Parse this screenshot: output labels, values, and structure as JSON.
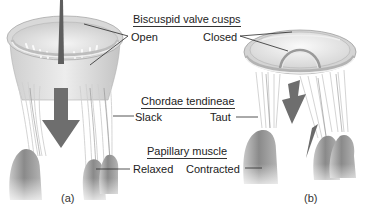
{
  "diagram": {
    "palette": {
      "background": "#ffffff",
      "tissue_light": "#e4e4e4",
      "tissue_mid": "#b8b8b8",
      "muscle_dark": "#8a8a8a",
      "arrow": "#6e6e6e",
      "leader_line": "#2a2a2a",
      "text": "#222222"
    },
    "sections": {
      "valve_cusps": {
        "header": "Biscuspid valve cusps",
        "left_state": "Open",
        "right_state": "Closed"
      },
      "chordae": {
        "header": "Chordae tendineae",
        "left_state": "Slack",
        "right_state": "Taut"
      },
      "papillary": {
        "header": "Papillary muscle",
        "left_state": "Relaxed",
        "right_state": "Contracted"
      }
    },
    "panels": [
      {
        "caption": "(a)",
        "state": "open",
        "arrow_direction": "down"
      },
      {
        "caption": "(b)",
        "state": "closed",
        "arrow_direction": "down-left"
      }
    ]
  }
}
